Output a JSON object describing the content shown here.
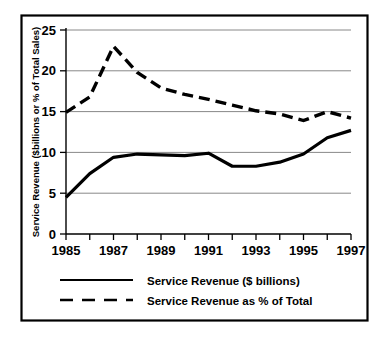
{
  "chart_data": {
    "type": "line",
    "title": "",
    "subtitle": "",
    "xlabel": "",
    "ylabel": "Service Revenue ($billions or % of Total Sales)",
    "x": [
      1985,
      1986,
      1987,
      1988,
      1989,
      1990,
      1991,
      1992,
      1993,
      1994,
      1995,
      1996,
      1997
    ],
    "xlim": [
      1985,
      1997
    ],
    "ylim": [
      0,
      25
    ],
    "xtick_labels": [
      "1985",
      "1987",
      "1989",
      "1991",
      "1993",
      "1995",
      "1997"
    ],
    "xtick_values": [
      1985,
      1987,
      1989,
      1991,
      1993,
      1995,
      1997
    ],
    "xminor_ticks": [
      1986,
      1988,
      1990,
      1992,
      1994,
      1996
    ],
    "ytick_labels": [
      "0",
      "5",
      "10",
      "15",
      "20",
      "25"
    ],
    "ytick_values": [
      0,
      5,
      10,
      15,
      20,
      25
    ],
    "grid": "horizontal",
    "legend_position": "below",
    "series": [
      {
        "name": "Service Revenue ($ billions)",
        "style": "solid",
        "color": "#000000",
        "values": [
          4.5,
          7.4,
          9.4,
          9.8,
          9.7,
          9.6,
          9.9,
          8.3,
          8.3,
          8.8,
          9.8,
          11.8,
          12.7
        ]
      },
      {
        "name": "Service Revenue as % of Total",
        "style": "dashed",
        "color": "#000000",
        "values": [
          14.9,
          16.8,
          23.0,
          19.8,
          17.9,
          17.1,
          16.5,
          15.8,
          15.1,
          14.7,
          13.9,
          15.0,
          14.2
        ]
      }
    ]
  },
  "legend": {
    "items": [
      {
        "label": "Service Revenue ($ billions)",
        "style": "solid"
      },
      {
        "label": "Service Revenue as % of Total",
        "style": "dashed"
      }
    ]
  },
  "axes": {
    "y_title": "Service Revenue ($billions or % of Total Sales)",
    "y_ticks": [
      "25",
      "20",
      "15",
      "10",
      "5",
      "0"
    ],
    "x_ticks": [
      "1985",
      "1987",
      "1989",
      "1991",
      "1993",
      "1995",
      "1997"
    ]
  },
  "colors": {
    "line": "#000000",
    "grid": "#7a7a7a",
    "border": "#000000",
    "background": "#ffffff"
  }
}
